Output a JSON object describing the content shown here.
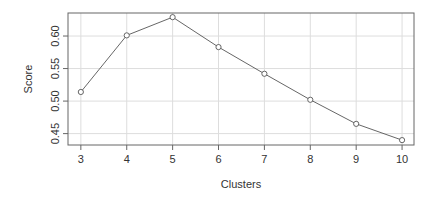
{
  "chart_data": {
    "type": "line",
    "title": "",
    "xlabel": "Clusters",
    "ylabel": "Score",
    "x": [
      3,
      4,
      5,
      6,
      7,
      8,
      9,
      10
    ],
    "series": [
      {
        "name": "Score",
        "values": [
          0.514,
          0.601,
          0.629,
          0.583,
          0.542,
          0.502,
          0.465,
          0.44
        ]
      }
    ],
    "xticks": [
      3,
      4,
      5,
      6,
      7,
      8,
      9,
      10
    ],
    "yticks": [
      0.45,
      0.5,
      0.55,
      0.6
    ],
    "ytick_labels": [
      "0.45",
      "0.50",
      "0.55",
      "0.60"
    ],
    "xlim": [
      2.72,
      10.26
    ],
    "ylim": [
      0.4325,
      0.6354
    ],
    "grid": true,
    "marker": "open-circle",
    "colors": {
      "line": "#555555",
      "grid": "#dddddd",
      "axis": "#666666"
    }
  }
}
